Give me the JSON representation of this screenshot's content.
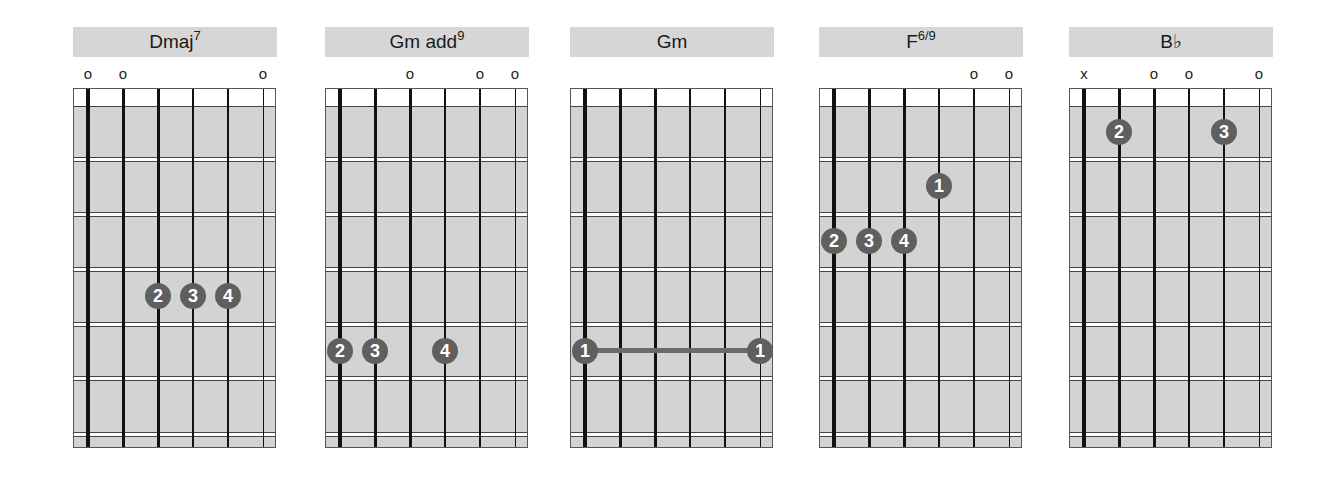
{
  "chords": [
    {
      "name": "Dmaj",
      "sup": "7",
      "markers": [
        {
          "string": 0,
          "symbol": "o"
        },
        {
          "string": 1,
          "symbol": "o"
        },
        {
          "string": 5,
          "symbol": "o"
        }
      ],
      "dots": [
        {
          "string": 2,
          "fret": 4,
          "finger": "2"
        },
        {
          "string": 3,
          "fret": 4,
          "finger": "3"
        },
        {
          "string": 4,
          "fret": 4,
          "finger": "4"
        }
      ],
      "barre": null
    },
    {
      "name": "Gm add",
      "sup": "9",
      "markers": [
        {
          "string": 2,
          "symbol": "o"
        },
        {
          "string": 4,
          "symbol": "o"
        },
        {
          "string": 5,
          "symbol": "o"
        }
      ],
      "dots": [
        {
          "string": 0,
          "fret": 5,
          "finger": "2"
        },
        {
          "string": 1,
          "fret": 5,
          "finger": "3"
        },
        {
          "string": 3,
          "fret": 5,
          "finger": "4"
        }
      ],
      "barre": null
    },
    {
      "name": "Gm",
      "sup": "",
      "markers": [],
      "dots": [
        {
          "string": 0,
          "fret": 5,
          "finger": "1"
        },
        {
          "string": 5,
          "fret": 5,
          "finger": "1"
        }
      ],
      "barre": {
        "from": 0,
        "to": 5,
        "fret": 5
      }
    },
    {
      "name": "F",
      "sup": "6/9",
      "markers": [
        {
          "string": 4,
          "symbol": "o"
        },
        {
          "string": 5,
          "symbol": "o"
        }
      ],
      "dots": [
        {
          "string": 3,
          "fret": 2,
          "finger": "1"
        },
        {
          "string": 0,
          "fret": 3,
          "finger": "2"
        },
        {
          "string": 1,
          "fret": 3,
          "finger": "3"
        },
        {
          "string": 2,
          "fret": 3,
          "finger": "4"
        }
      ],
      "barre": null
    },
    {
      "name": "B♭",
      "sup": "",
      "markers": [
        {
          "string": 0,
          "symbol": "x"
        },
        {
          "string": 2,
          "symbol": "o"
        },
        {
          "string": 3,
          "symbol": "o"
        },
        {
          "string": 5,
          "symbol": "o"
        }
      ],
      "dots": [
        {
          "string": 1,
          "fret": 1,
          "finger": "2"
        },
        {
          "string": 4,
          "fret": 1,
          "finger": "3"
        }
      ],
      "barre": null
    }
  ],
  "layout": {
    "chord_left": [
      73,
      325,
      570,
      819,
      1069
    ],
    "string_offsets": [
      15,
      50,
      85,
      120,
      155,
      190
    ],
    "string_widths": [
      4,
      3,
      3,
      2,
      1.5,
      1
    ],
    "fret_tops": [
      68,
      123,
      178,
      233,
      287,
      343
    ],
    "fret_centers": [
      43,
      97,
      152,
      207,
      262,
      316
    ]
  },
  "colors": {
    "board": "#d3d3d3",
    "title_bar": "#d6d6d6",
    "dot": "#5f5f5f",
    "string": "#111111"
  }
}
